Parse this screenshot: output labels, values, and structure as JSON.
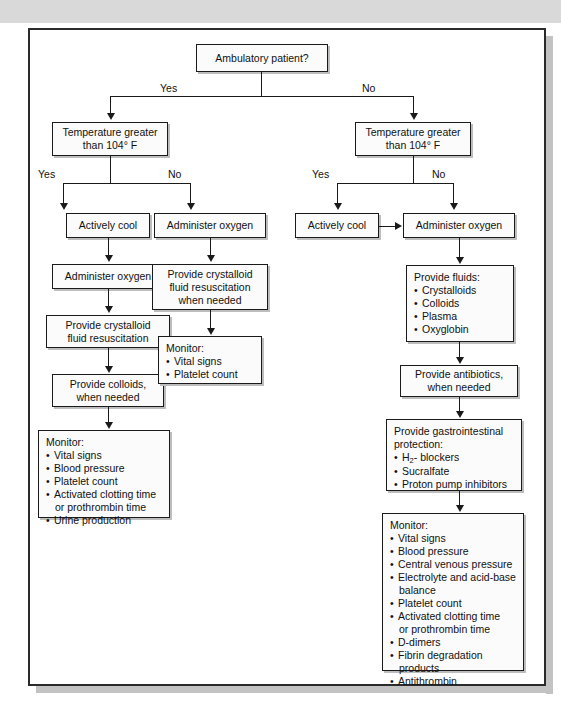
{
  "figure": {
    "caption": ""
  },
  "decisions": {
    "root": "Ambulatory patient?",
    "temp_left_l1": "Temperature greater",
    "temp_left_l2": "than 104° F",
    "temp_right_l1": "Temperature greater",
    "temp_right_l2": "than 104° F"
  },
  "edge_labels": {
    "root_yes": "Yes",
    "root_no": "No",
    "left_yes": "Yes",
    "left_no": "No",
    "right_yes": "Yes",
    "right_no": "No"
  },
  "branch_a": {
    "actively_cool": "Actively cool",
    "administer_oxygen": "Administer oxygen",
    "crystalloid_l1": "Provide crystalloid",
    "crystalloid_l2": "fluid resuscitation",
    "colloids_l1": "Provide colloids,",
    "colloids_l2": "when needed",
    "monitor_title": "Monitor:",
    "monitor_items": [
      "Vital signs",
      "Blood pressure",
      "Platelet count",
      "Activated clotting time",
      "Urine production"
    ],
    "monitor_item4_cont": "or prothrombin time"
  },
  "branch_b": {
    "administer_oxygen": "Administer oxygen",
    "crystalloid_l1": "Provide crystalloid",
    "crystalloid_l2": "fluid resuscitation",
    "crystalloid_l3": "when needed",
    "monitor_title": "Monitor:",
    "monitor_items": [
      "Vital signs",
      "Platelet count"
    ]
  },
  "branch_c": {
    "actively_cool": "Actively cool"
  },
  "branch_d": {
    "administer_oxygen": "Administer oxygen",
    "fluids_title": "Provide fluids:",
    "fluids_items": [
      "Crystalloids",
      "Colloids",
      "Plasma",
      "Oxyglobin"
    ],
    "antibiotics_l1": "Provide antibiotics,",
    "antibiotics_l2": "when needed",
    "gi_title_l1": "Provide gastrointestinal",
    "gi_title_l2": "protection:",
    "gi_item1_pre": "H",
    "gi_item1_sub": "2",
    "gi_item1_post": "- blockers",
    "gi_items_rest": [
      "Sucralfate",
      "Proton pump inhibitors"
    ],
    "monitor_title": "Monitor:",
    "monitor_items": [
      "Vital signs",
      "Blood pressure",
      "Central venous pressure",
      "Electrolyte and acid-base",
      "Platelet count",
      "Activated clotting time",
      "D-dimers",
      "Fibrin degradation",
      "Antithrombin"
    ],
    "monitor_item4_cont": "balance",
    "monitor_item6_cont": "or prothrombin time",
    "monitor_item8_cont": "products"
  },
  "colors": {
    "ink": "#1a1a1a",
    "box_fill": "#fbfbfb",
    "frame": "#2b2b2b",
    "band": "#d9d9d9",
    "shadow": "#bdbdbd"
  }
}
